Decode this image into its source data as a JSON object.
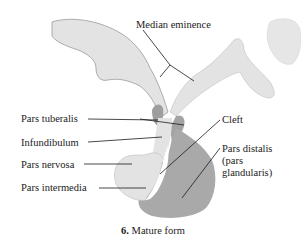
{
  "diagram": {
    "caption": {
      "number": "6.",
      "text": "Mature form"
    },
    "labels": {
      "median_eminence": "Median eminence",
      "pars_tuberalis": "Pars tuberalis",
      "infundibulum": "Infundibulum",
      "pars_nervosa": "Pars nervosa",
      "pars_intermedia": "Pars intermedia",
      "cleft": "Cleft",
      "pars_distalis_line1": "Pars distalis",
      "pars_distalis_line2": "(pars",
      "pars_distalis_line3": "glandularis)"
    },
    "colors": {
      "neural_tissue": "#e3e3e3",
      "neural_outline": "#9a9a9a",
      "glandular_tissue": "#a9a9a9",
      "pars_tuberalis": "#9e9e9e",
      "cleft": "#ffffff",
      "leader_line": "#1a1a1a",
      "text": "#222222",
      "background": "#ffffff"
    }
  }
}
